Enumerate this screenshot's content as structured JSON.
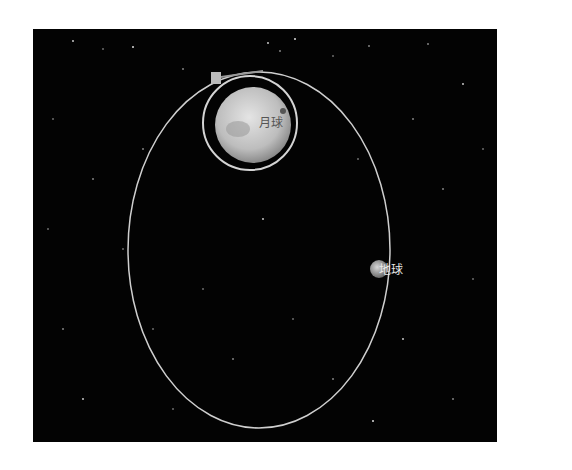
{
  "diagram": {
    "title": "",
    "background": "#030303",
    "orbit_color": "#cfcfcf",
    "bodies": {
      "moon": {
        "label": "月球"
      },
      "earth": {
        "label": "地球"
      }
    },
    "spacecraft": {
      "name": "spacecraft"
    },
    "orbits": [
      {
        "name": "transfer-orbit",
        "type": "large ellipse"
      },
      {
        "name": "lunar-orbit",
        "type": "circular orbit around moon"
      }
    ]
  }
}
